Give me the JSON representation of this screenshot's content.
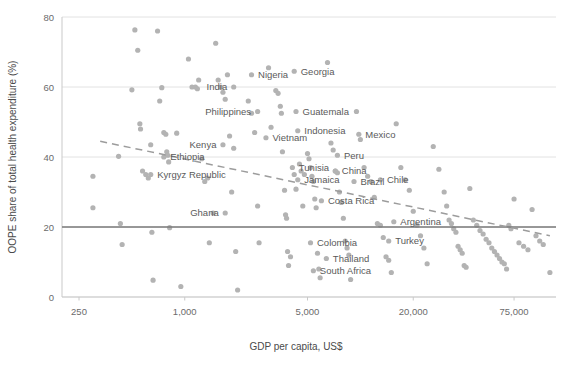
{
  "chart_data": {
    "type": "scatter",
    "title": "",
    "xlabel": "GDP per capita, US$",
    "ylabel": "OOPE share of total health expenditure (%)",
    "x_scale": "log",
    "xlim": [
      200,
      130000
    ],
    "ylim": [
      0,
      80
    ],
    "x_ticks": [
      250,
      1000,
      5000,
      20000,
      75000
    ],
    "x_tick_labels": [
      "250",
      "1,000",
      "5,000",
      "20,000",
      "75,000"
    ],
    "y_ticks": [
      0,
      20,
      40,
      60,
      80
    ],
    "y_tick_labels": [
      "0",
      "20",
      "40",
      "60",
      "80"
    ],
    "grid": true,
    "legend": "none",
    "reference_line": {
      "axis": "y",
      "value": 20,
      "style": "solid",
      "color": "#7a7a7a"
    },
    "trend_line": {
      "style": "dashed",
      "color": "#9c9c9c",
      "from": [
        330,
        44.5
      ],
      "to": [
        120000,
        17.5
      ]
    },
    "marker_color": "#b3b3b3",
    "points": [
      {
        "x": 300,
        "y": 25.5
      },
      {
        "x": 300,
        "y": 34.5
      },
      {
        "x": 420,
        "y": 40.2
      },
      {
        "x": 430,
        "y": 21.0
      },
      {
        "x": 440,
        "y": 15.0
      },
      {
        "x": 500,
        "y": 59.2
      },
      {
        "x": 520,
        "y": 76.3
      },
      {
        "x": 540,
        "y": 70.5
      },
      {
        "x": 555,
        "y": 49.5
      },
      {
        "x": 560,
        "y": 48.0
      },
      {
        "x": 575,
        "y": 36.0
      },
      {
        "x": 600,
        "y": 35.0
      },
      {
        "x": 620,
        "y": 34.0
      },
      {
        "x": 640,
        "y": 43.5
      },
      {
        "x": 650,
        "y": 18.5
      },
      {
        "x": 660,
        "y": 4.8
      },
      {
        "x": 700,
        "y": 76.0
      },
      {
        "x": 720,
        "y": 56.0
      },
      {
        "x": 740,
        "y": 59.8
      },
      {
        "x": 760,
        "y": 47.0
      },
      {
        "x": 780,
        "y": 46.5
      },
      {
        "x": 790,
        "y": 41.5
      },
      {
        "x": 800,
        "y": 40.5
      },
      {
        "x": 810,
        "y": 38.6
      },
      {
        "x": 820,
        "y": 19.8
      },
      {
        "x": 900,
        "y": 46.8
      },
      {
        "x": 950,
        "y": 3.0
      },
      {
        "x": 1050,
        "y": 68.0
      },
      {
        "x": 1100,
        "y": 60.0
      },
      {
        "x": 1150,
        "y": 60.0
      },
      {
        "x": 1180,
        "y": 59.5
      },
      {
        "x": 1200,
        "y": 62.0
      },
      {
        "x": 1250,
        "y": 39.5
      },
      {
        "x": 1300,
        "y": 33.0
      },
      {
        "x": 1350,
        "y": 34.0
      },
      {
        "x": 1380,
        "y": 15.5
      },
      {
        "x": 1450,
        "y": 24.0
      },
      {
        "x": 1500,
        "y": 72.5
      },
      {
        "x": 1550,
        "y": 62.0
      },
      {
        "x": 1600,
        "y": 60.0
      },
      {
        "x": 1650,
        "y": 58.5
      },
      {
        "x": 1700,
        "y": 56.5
      },
      {
        "x": 1750,
        "y": 63.5
      },
      {
        "x": 1800,
        "y": 46.0
      },
      {
        "x": 1850,
        "y": 30.0
      },
      {
        "x": 1900,
        "y": 42.5
      },
      {
        "x": 1950,
        "y": 13.0
      },
      {
        "x": 2000,
        "y": 2.0
      },
      {
        "x": 2300,
        "y": 56.0
      },
      {
        "x": 2400,
        "y": 52.5
      },
      {
        "x": 2500,
        "y": 47.0
      },
      {
        "x": 2600,
        "y": 26.0
      },
      {
        "x": 2650,
        "y": 15.5
      },
      {
        "x": 3000,
        "y": 65.5
      },
      {
        "x": 3100,
        "y": 48.5
      },
      {
        "x": 3300,
        "y": 59.0
      },
      {
        "x": 3400,
        "y": 58.2
      },
      {
        "x": 3500,
        "y": 54.5
      },
      {
        "x": 3550,
        "y": 52.5
      },
      {
        "x": 3600,
        "y": 41.5
      },
      {
        "x": 3700,
        "y": 30.5
      },
      {
        "x": 3750,
        "y": 23.5
      },
      {
        "x": 3800,
        "y": 22.5
      },
      {
        "x": 3850,
        "y": 13.0
      },
      {
        "x": 3900,
        "y": 9.0
      },
      {
        "x": 4000,
        "y": 11.5
      },
      {
        "x": 4200,
        "y": 35.0
      },
      {
        "x": 4300,
        "y": 30.8
      },
      {
        "x": 4500,
        "y": 38.0
      },
      {
        "x": 4600,
        "y": 36.0
      },
      {
        "x": 4700,
        "y": 26.0
      },
      {
        "x": 4800,
        "y": 35.0
      },
      {
        "x": 5000,
        "y": 41.0
      },
      {
        "x": 5100,
        "y": 39.5
      },
      {
        "x": 5200,
        "y": 37.0
      },
      {
        "x": 5300,
        "y": 34.5
      },
      {
        "x": 5400,
        "y": 33.0
      },
      {
        "x": 5500,
        "y": 28.0
      },
      {
        "x": 5600,
        "y": 25.5
      },
      {
        "x": 5700,
        "y": 12.5
      },
      {
        "x": 5800,
        "y": 8.0
      },
      {
        "x": 5900,
        "y": 5.5
      },
      {
        "x": 6500,
        "y": 67.0
      },
      {
        "x": 6800,
        "y": 44.0
      },
      {
        "x": 7000,
        "y": 42.0
      },
      {
        "x": 7200,
        "y": 36.0
      },
      {
        "x": 7400,
        "y": 35.5
      },
      {
        "x": 7600,
        "y": 30.0
      },
      {
        "x": 7800,
        "y": 27.0
      },
      {
        "x": 8000,
        "y": 22.5
      },
      {
        "x": 8200,
        "y": 16.0
      },
      {
        "x": 8400,
        "y": 14.0
      },
      {
        "x": 8600,
        "y": 12.0
      },
      {
        "x": 8800,
        "y": 5.0
      },
      {
        "x": 9500,
        "y": 53.0
      },
      {
        "x": 10000,
        "y": 45.0
      },
      {
        "x": 10500,
        "y": 37.0
      },
      {
        "x": 11000,
        "y": 34.5
      },
      {
        "x": 11500,
        "y": 33.0
      },
      {
        "x": 12000,
        "y": 28.5
      },
      {
        "x": 12500,
        "y": 21.0
      },
      {
        "x": 13000,
        "y": 20.5
      },
      {
        "x": 13500,
        "y": 17.0
      },
      {
        "x": 14000,
        "y": 11.5
      },
      {
        "x": 14500,
        "y": 10.5
      },
      {
        "x": 15000,
        "y": 7.0
      },
      {
        "x": 16000,
        "y": 49.5
      },
      {
        "x": 17000,
        "y": 37.0
      },
      {
        "x": 18000,
        "y": 33.5
      },
      {
        "x": 19000,
        "y": 30.5
      },
      {
        "x": 20000,
        "y": 24.5
      },
      {
        "x": 21000,
        "y": 20.5
      },
      {
        "x": 22000,
        "y": 17.5
      },
      {
        "x": 23000,
        "y": 14.0
      },
      {
        "x": 24000,
        "y": 9.5
      },
      {
        "x": 26000,
        "y": 43.0
      },
      {
        "x": 28000,
        "y": 36.5
      },
      {
        "x": 30000,
        "y": 30.0
      },
      {
        "x": 31000,
        "y": 26.0
      },
      {
        "x": 32000,
        "y": 22.0
      },
      {
        "x": 33000,
        "y": 21.0
      },
      {
        "x": 34000,
        "y": 19.5
      },
      {
        "x": 35000,
        "y": 18.5
      },
      {
        "x": 36000,
        "y": 14.5
      },
      {
        "x": 37000,
        "y": 13.5
      },
      {
        "x": 38000,
        "y": 12.5
      },
      {
        "x": 39000,
        "y": 9.0
      },
      {
        "x": 40000,
        "y": 8.5
      },
      {
        "x": 42000,
        "y": 31.0
      },
      {
        "x": 44000,
        "y": 22.0
      },
      {
        "x": 46000,
        "y": 20.5
      },
      {
        "x": 48000,
        "y": 19.0
      },
      {
        "x": 50000,
        "y": 18.0
      },
      {
        "x": 52000,
        "y": 16.5
      },
      {
        "x": 54000,
        "y": 15.5
      },
      {
        "x": 56000,
        "y": 14.0
      },
      {
        "x": 58000,
        "y": 13.0
      },
      {
        "x": 60000,
        "y": 12.0
      },
      {
        "x": 62000,
        "y": 11.0
      },
      {
        "x": 64000,
        "y": 10.0
      },
      {
        "x": 66000,
        "y": 9.5
      },
      {
        "x": 68000,
        "y": 8.0
      },
      {
        "x": 70000,
        "y": 20.5
      },
      {
        "x": 72000,
        "y": 19.5
      },
      {
        "x": 75000,
        "y": 28.0
      },
      {
        "x": 80000,
        "y": 15.5
      },
      {
        "x": 85000,
        "y": 14.5
      },
      {
        "x": 90000,
        "y": 13.5
      },
      {
        "x": 95000,
        "y": 25.0
      },
      {
        "x": 100000,
        "y": 17.5
      },
      {
        "x": 105000,
        "y": 16.0
      },
      {
        "x": 110000,
        "y": 15.0
      },
      {
        "x": 120000,
        "y": 7.0
      }
    ],
    "labeled_points": [
      {
        "name": "Ethiopia",
        "x": 760,
        "y": 40.0,
        "anchor": "start"
      },
      {
        "name": "Kyrgyz Republic",
        "x": 640,
        "y": 35.0,
        "anchor": "start"
      },
      {
        "name": "Kenya",
        "x": 1650,
        "y": 43.5,
        "anchor": "end"
      },
      {
        "name": "Ghana",
        "x": 1700,
        "y": 24.0,
        "anchor": "end"
      },
      {
        "name": "India",
        "x": 1900,
        "y": 60.0,
        "anchor": "end"
      },
      {
        "name": "Nigeria",
        "x": 2400,
        "y": 63.5,
        "anchor": "start"
      },
      {
        "name": "Philippines",
        "x": 2600,
        "y": 53.0,
        "anchor": "end"
      },
      {
        "name": "Vietnam",
        "x": 2900,
        "y": 45.5,
        "anchor": "start"
      },
      {
        "name": "Georgia",
        "x": 4200,
        "y": 64.5,
        "anchor": "start"
      },
      {
        "name": "Guatemala",
        "x": 4300,
        "y": 53.0,
        "anchor": "start"
      },
      {
        "name": "Indonesia",
        "x": 4400,
        "y": 47.5,
        "anchor": "start"
      },
      {
        "name": "Tunisia",
        "x": 4100,
        "y": 37.0,
        "anchor": "start"
      },
      {
        "name": "Jamaica",
        "x": 4400,
        "y": 33.5,
        "anchor": "start"
      },
      {
        "name": "Costa Rica",
        "x": 6000,
        "y": 27.5,
        "anchor": "start"
      },
      {
        "name": "Colombia",
        "x": 5200,
        "y": 15.5,
        "anchor": "start"
      },
      {
        "name": "Thailand",
        "x": 6400,
        "y": 11.0,
        "anchor": "start"
      },
      {
        "name": "South Africa",
        "x": 5400,
        "y": 7.5,
        "anchor": "start"
      },
      {
        "name": "Peru",
        "x": 7400,
        "y": 40.5,
        "anchor": "start"
      },
      {
        "name": "China",
        "x": 7200,
        "y": 36.0,
        "anchor": "start"
      },
      {
        "name": "Brazil",
        "x": 9200,
        "y": 33.0,
        "anchor": "start"
      },
      {
        "name": "Mexico",
        "x": 9800,
        "y": 46.5,
        "anchor": "start"
      },
      {
        "name": "Chile",
        "x": 13000,
        "y": 33.5,
        "anchor": "start"
      },
      {
        "name": "Argentina",
        "x": 15500,
        "y": 21.5,
        "anchor": "start"
      },
      {
        "name": "Turkey",
        "x": 14500,
        "y": 16.0,
        "anchor": "start"
      }
    ]
  },
  "axes": {
    "x_title": "GDP per capita, US$",
    "y_title": "OOPE share of total health expenditure (%)"
  }
}
